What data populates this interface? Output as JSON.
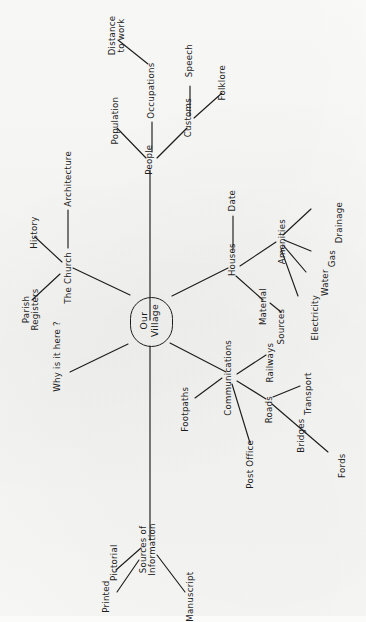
{
  "diagram": {
    "orientation": "rotated-90-ccw",
    "ink_color": "#1d1d1d",
    "paper_color": "#fbfbfa",
    "center": {
      "label": "Our\nVillage",
      "shape": "stadium"
    },
    "nodes": {
      "the_church": "The Church",
      "architecture": "Architecture",
      "history": "History",
      "parish_registers": "Parish\nRegisters",
      "people": "People",
      "population": "Population",
      "occupations": "Occupations",
      "distance_to_work": "Distance\nto work",
      "customs": "Customs",
      "speech": "Speech",
      "folklore": "Folklore",
      "houses": "Houses",
      "date": "Date",
      "material": "Material",
      "sources": "Sources",
      "amenities": "Amenities",
      "electricity": "Electricity",
      "water": "Water",
      "gas": "Gas",
      "drainage": "Drainage",
      "communications": "Communications",
      "footpaths": "Footpaths",
      "post_office": "Post Office",
      "railways": "Railways",
      "roads": "Roads",
      "transport": "Transport",
      "bridges": "Bridges",
      "fords": "Fords",
      "why_is_it_here": "Why is it here ?",
      "sources_of_information": "Sources of\nInformation",
      "printed": "Printed",
      "pictorial": "Pictorial",
      "manuscript": "Manuscript"
    },
    "edges": [
      {
        "from": "Our Village",
        "to": "The Church"
      },
      {
        "from": "Our Village",
        "to": "People"
      },
      {
        "from": "Our Village",
        "to": "Houses"
      },
      {
        "from": "Our Village",
        "to": "Communications"
      },
      {
        "from": "Our Village",
        "to": "Why is it here ?"
      },
      {
        "from": "Our Village",
        "to": "Sources of Information"
      },
      {
        "from": "The Church",
        "to": "Architecture"
      },
      {
        "from": "The Church",
        "to": "History"
      },
      {
        "from": "The Church",
        "to": "Parish Registers"
      },
      {
        "from": "People",
        "to": "Population"
      },
      {
        "from": "People",
        "to": "Occupations"
      },
      {
        "from": "People",
        "to": "Customs"
      },
      {
        "from": "Occupations",
        "to": "Distance to work"
      },
      {
        "from": "Customs",
        "to": "Speech"
      },
      {
        "from": "Customs",
        "to": "Folklore"
      },
      {
        "from": "Houses",
        "to": "Date"
      },
      {
        "from": "Houses",
        "to": "Material"
      },
      {
        "from": "Houses",
        "to": "Amenities"
      },
      {
        "from": "Material",
        "to": "Sources"
      },
      {
        "from": "Amenities",
        "to": "Electricity"
      },
      {
        "from": "Amenities",
        "to": "Water"
      },
      {
        "from": "Amenities",
        "to": "Gas"
      },
      {
        "from": "Amenities",
        "to": "Drainage"
      },
      {
        "from": "Communications",
        "to": "Footpaths"
      },
      {
        "from": "Communications",
        "to": "Post Office"
      },
      {
        "from": "Communications",
        "to": "Railways"
      },
      {
        "from": "Communications",
        "to": "Roads"
      },
      {
        "from": "Roads",
        "to": "Transport"
      },
      {
        "from": "Roads",
        "to": "Bridges"
      },
      {
        "from": "Bridges",
        "to": "Fords"
      },
      {
        "from": "Sources of Information",
        "to": "Printed"
      },
      {
        "from": "Sources of Information",
        "to": "Pictorial"
      },
      {
        "from": "Sources of Information",
        "to": "Manuscript"
      }
    ]
  }
}
